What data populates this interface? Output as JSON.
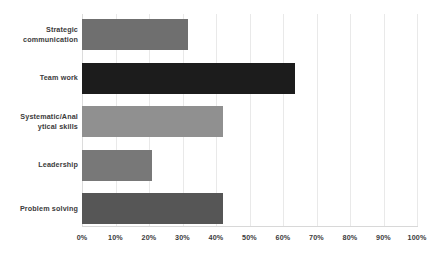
{
  "chart_data": {
    "type": "bar",
    "orientation": "horizontal",
    "title": "",
    "subtitle": "",
    "xlabel": "",
    "ylabel": "",
    "xlim": [
      0,
      100
    ],
    "x_tick_labels": [
      "0%",
      "10%",
      "20%",
      "30%",
      "40%",
      "50%",
      "60%",
      "70%",
      "80%",
      "90%",
      "100%"
    ],
    "x_tick_values": [
      0,
      10,
      20,
      30,
      40,
      50,
      60,
      70,
      80,
      90,
      100
    ],
    "grid": true,
    "grid_axis": "x",
    "legend": false,
    "legend_position": "none",
    "value_unit": "%",
    "categories": [
      "Strategic communication",
      "Team work",
      "Systematic/Anal ytical skills",
      "Leadership",
      "Problem solving"
    ],
    "values": [
      31.5,
      63.5,
      42.0,
      21.0,
      42.0
    ],
    "bar_colors": [
      "#6f6f6f",
      "#1c1c1c",
      "#909090",
      "#787878",
      "#565656"
    ],
    "series": [
      {
        "name": "",
        "values": [
          31.5,
          63.5,
          42.0,
          21.0,
          42.0
        ]
      }
    ]
  },
  "bars": [
    {
      "label_line1": "Strategic",
      "label_line2": "communication",
      "value": 31.5,
      "color": "#6f6f6f"
    },
    {
      "label_line1": "Team work",
      "label_line2": "",
      "value": 63.5,
      "color": "#1c1c1c"
    },
    {
      "label_line1": "Systematic/Anal",
      "label_line2": "ytical skills",
      "value": 42.0,
      "color": "#909090"
    },
    {
      "label_line1": "Leadership",
      "label_line2": "",
      "value": 21.0,
      "color": "#787878"
    },
    {
      "label_line1": "Problem solving",
      "label_line2": "",
      "value": 42.0,
      "color": "#565656"
    }
  ],
  "ticks": [
    {
      "label": "0%",
      "value": 0
    },
    {
      "label": "10%",
      "value": 10
    },
    {
      "label": "20%",
      "value": 20
    },
    {
      "label": "30%",
      "value": 30
    },
    {
      "label": "40%",
      "value": 40
    },
    {
      "label": "50%",
      "value": 50
    },
    {
      "label": "60%",
      "value": 60
    },
    {
      "label": "70%",
      "value": 70
    },
    {
      "label": "80%",
      "value": 80
    },
    {
      "label": "90%",
      "value": 90
    },
    {
      "label": "100%",
      "value": 100
    }
  ],
  "style": {
    "background": "#ffffff",
    "gridline_color": "#e9e9e9",
    "axis_line_color": "#d8d8d8",
    "text_color": "#3b3b3b"
  }
}
